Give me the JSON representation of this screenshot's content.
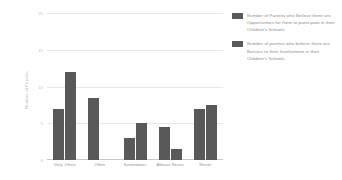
{
  "chart_data": {
    "type": "bar",
    "title": "",
    "xlabel": "",
    "ylabel": "Number of Parents",
    "ylim": [
      0,
      20
    ],
    "yticks": [
      0,
      5,
      10,
      15,
      20
    ],
    "grid": true,
    "legend_position": "right",
    "categories": [
      "Very Often",
      "Often",
      "Sometimes",
      "Almost Never",
      "Never"
    ],
    "series": [
      {
        "name": "Number of Parents who Believe there are Opportunities for them to participate in their Children's Schools",
        "color": "#595959",
        "values": [
          7,
          8.5,
          3,
          4.5,
          7
        ]
      },
      {
        "name": "Number of parents who believe there are Barriers to their Involvement in their Children's Schools",
        "color": "#595959",
        "values": [
          12,
          null,
          5,
          1.5,
          7.5
        ]
      }
    ]
  },
  "axis": {
    "tick_labels": [
      "20",
      "15",
      "10",
      "5",
      "0"
    ],
    "y_title": "Number of Parents"
  },
  "legend": {
    "entries": [
      "Number of Parents who Believe there are Opportunities for them to participate in their Children's Schools",
      "Number of parents who believe there are Barriers to their Involvement in their Children's Schools"
    ]
  }
}
